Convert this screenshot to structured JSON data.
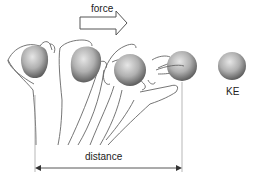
{
  "diagram": {
    "labels": {
      "force": "force",
      "kinetic_energy": "KE",
      "distance": "distance"
    },
    "elements": {
      "force_arrow": {
        "direction": "right",
        "style": "hollow block arrow"
      },
      "distance_arrow": {
        "direction": "double-headed horizontal",
        "from_x": 35,
        "to_x": 182
      },
      "hand_stages": 4,
      "balls": 5,
      "released_ball_label": "KE"
    },
    "colors": {
      "line": "#555555",
      "ball_light": "#d9d9d9",
      "ball_dark": "#6e6e6e",
      "text": "#222222",
      "background": "#ffffff"
    }
  }
}
